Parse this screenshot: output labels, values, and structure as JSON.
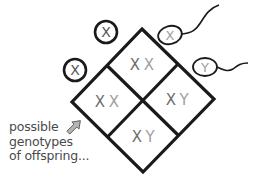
{
  "diagram": {
    "type": "punnett-square",
    "colors": {
      "outline": "#1a1a1a",
      "maternal_letter": "#6e6e6e",
      "paternal_letter": "#a0a0a0",
      "caption": "#4a4a4a",
      "arrow_fill": "#b5b5b5"
    },
    "eggs": [
      {
        "label": "X"
      },
      {
        "label": "X"
      }
    ],
    "sperm": [
      {
        "label": "X"
      },
      {
        "label": "Y"
      }
    ],
    "cells": [
      {
        "position": "top",
        "maternal": "X",
        "paternal": "X"
      },
      {
        "position": "left",
        "maternal": "X",
        "paternal": "X"
      },
      {
        "position": "right",
        "maternal": "X",
        "paternal": "Y"
      },
      {
        "position": "bottom",
        "maternal": "X",
        "paternal": "Y"
      }
    ],
    "caption": {
      "line1": "possible",
      "line2": "genotypes",
      "line3": "of offspring..."
    },
    "arrow_icon": "arrow-up-right-icon"
  }
}
